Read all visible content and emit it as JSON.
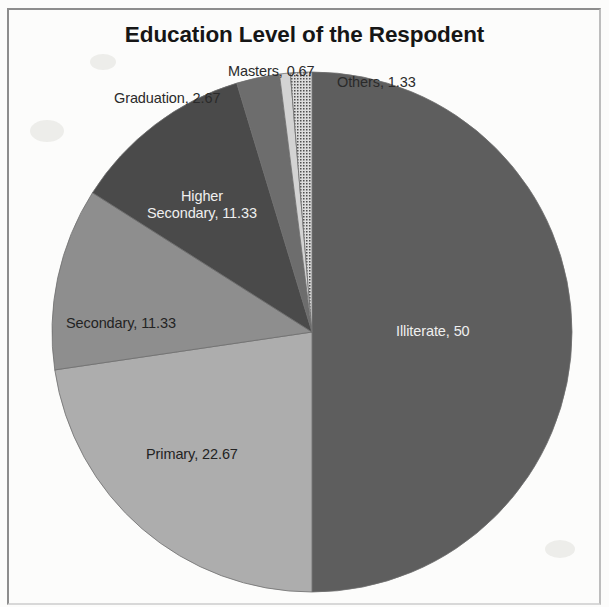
{
  "figure": {
    "title": "Education Level of the Respodent",
    "frame_color": "#8d8d8d",
    "background": "#fcfcfb"
  },
  "chart_data": {
    "type": "pie",
    "title": "Education Level of the Respodent",
    "xlabel": "",
    "ylabel": "",
    "units": "percent",
    "total": 100,
    "start_angle_deg": 0,
    "direction": "clockwise",
    "legend": "none",
    "labels_show_name_and_value": true,
    "categories": [
      "Illiterate",
      "Primary",
      "Secondary",
      "Higher Secondary",
      "Graduation",
      "Masters",
      "Others"
    ],
    "values": [
      50,
      22.67,
      11.33,
      11.33,
      2.67,
      0.67,
      1.33
    ],
    "slices": [
      {
        "name": "Illiterate",
        "value": 50,
        "label": "Illiterate, 50",
        "color": "#5e5e5e",
        "label_placement": "inside",
        "label_color": "#efefef"
      },
      {
        "name": "Primary",
        "value": 22.67,
        "label": "Primary, 22.67",
        "color": "#adadad",
        "label_placement": "inside",
        "label_color": "#232323"
      },
      {
        "name": "Secondary",
        "value": 11.33,
        "label": "Secondary, 11.33",
        "color": "#8e8e8e",
        "label_placement": "inside",
        "label_color": "#232323"
      },
      {
        "name": "Higher Secondary",
        "value": 11.33,
        "label_line1": "Higher",
        "label_line2": "Secondary, 11.33",
        "label": "Higher Secondary, 11.33",
        "color": "#4a4a4a",
        "label_placement": "inside",
        "label_color": "#efefef"
      },
      {
        "name": "Graduation",
        "value": 2.67,
        "label": "Graduation, 2.67",
        "color": "#6d6d6d",
        "label_placement": "outside",
        "label_color": "#2a2a2a"
      },
      {
        "name": "Masters",
        "value": 0.67,
        "label": "Masters, 0.67",
        "color": "#d3d3d3",
        "label_placement": "outside",
        "label_color": "#2a2a2a"
      },
      {
        "name": "Others",
        "value": 1.33,
        "label": "Others, 1.33",
        "color": "#c6c6c6",
        "pattern": "dotted",
        "label_placement": "outside",
        "label_color": "#2a2a2a"
      }
    ]
  }
}
